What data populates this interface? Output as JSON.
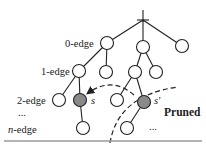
{
  "diagram": {
    "type": "search-tree-pruning",
    "level_labels": [
      {
        "id": "0",
        "text": "0-edge"
      },
      {
        "id": "1",
        "text": "1-edge"
      },
      {
        "id": "2",
        "text": "2-edge"
      },
      {
        "id": "ellipsis",
        "text": "..."
      },
      {
        "id": "n",
        "text": "n-edge",
        "italic_prefix": "n",
        "suffix": "-edge"
      }
    ],
    "nodes": [
      {
        "id": "a",
        "level": 0,
        "highlighted": false
      },
      {
        "id": "b",
        "level": 0,
        "highlighted": false
      },
      {
        "id": "c",
        "level": 0,
        "highlighted": false
      },
      {
        "id": "d",
        "level": 1,
        "parent": "a",
        "highlighted": false
      },
      {
        "id": "e",
        "level": 1,
        "parent": "a",
        "highlighted": false
      },
      {
        "id": "f",
        "level": 1,
        "parent": "b",
        "highlighted": false
      },
      {
        "id": "g",
        "level": 1,
        "parent": "b",
        "highlighted": false
      },
      {
        "id": "h",
        "level": 2,
        "parent": "d",
        "highlighted": false
      },
      {
        "id": "s",
        "level": 2,
        "parent": "d",
        "highlighted": true,
        "label": "s"
      },
      {
        "id": "i",
        "level": 2,
        "parent": "f",
        "highlighted": false
      },
      {
        "id": "s2",
        "level": 2,
        "parent": "f",
        "highlighted": true,
        "label": "s'"
      },
      {
        "id": "j",
        "level": 3,
        "parent": "s",
        "highlighted": false
      },
      {
        "id": "k",
        "level": 3,
        "parent": "s2",
        "highlighted": false
      }
    ],
    "node_labels": {
      "s": "s",
      "s_prime": "s'"
    },
    "pruned_label": "Pruned",
    "pruned_ellipsis": "...",
    "colors": {
      "highlight_fill": "#8a8a8a",
      "stroke": "#222222",
      "rule": "#9a9a9a"
    }
  }
}
